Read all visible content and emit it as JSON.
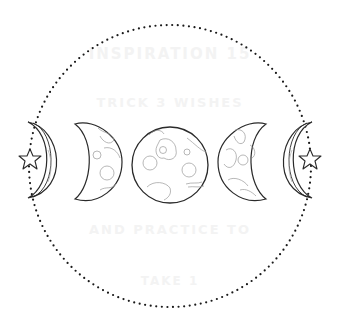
{
  "ghost_text": [
    "INSPIRATION 15",
    "TRICK 3 WISHES",
    "AND PRACTICE TO",
    "TAKE 1"
  ],
  "colors": {
    "background": "#ffffff",
    "outline": "#2a2a2a",
    "detail": "#9a9a9a",
    "dots": "#1a1a1a"
  },
  "elements": {
    "circle": {
      "label": "dotted-ring",
      "cx": 170,
      "cy": 166,
      "r": 141
    },
    "phases": [
      "waxing-crescent",
      "waxing-gibbous",
      "full-moon",
      "waning-gibbous",
      "waning-crescent"
    ],
    "stars": [
      "left-star",
      "right-star"
    ]
  }
}
